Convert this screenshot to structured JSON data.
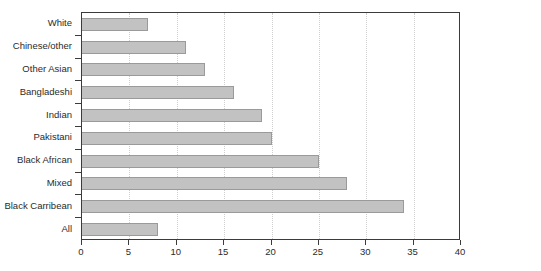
{
  "chart_data": {
    "type": "bar",
    "orientation": "horizontal",
    "title": "",
    "subtitle": "",
    "xlabel": "",
    "ylabel": "",
    "xlim": [
      0,
      40
    ],
    "xticks": [
      0,
      5,
      10,
      15,
      20,
      25,
      30,
      35,
      40
    ],
    "grid": true,
    "legend": false,
    "categories": [
      "White",
      "Chinese/other",
      "Other Asian",
      "Bangladeshi",
      "Indian",
      "Pakistani",
      "Black African",
      "Mixed",
      "Black Carribean",
      "All"
    ],
    "values": [
      7,
      11,
      13,
      16,
      19,
      20,
      25,
      28,
      34,
      8
    ],
    "colors": {
      "bar_fill": "#c2c2c2",
      "bar_stroke": "#9a9a9a",
      "axis": "#3b3b3b",
      "gridline": "#cfcfcf",
      "text": "#2b2b2b",
      "background": "#ffffff"
    }
  }
}
